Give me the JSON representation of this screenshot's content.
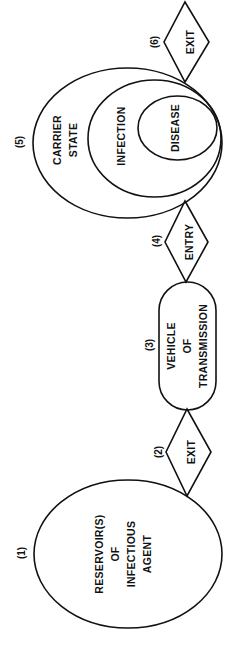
{
  "diagram": {
    "type": "chain-of-infection",
    "orientation": "rotated -90deg (reads bottom to top)",
    "nodes": [
      {
        "id": "reservoir",
        "number": "(1)",
        "shape": "ellipse",
        "lines": [
          "RESERVOIR(S)",
          "OF",
          "INFECTIOUS",
          "AGENT"
        ]
      },
      {
        "id": "exit-1",
        "number": "(2)",
        "shape": "diamond",
        "lines": [
          "EXIT"
        ]
      },
      {
        "id": "vehicle",
        "number": "(3)",
        "shape": "pill",
        "lines": [
          "VEHICLE",
          "OF",
          "TRANSMISSION"
        ]
      },
      {
        "id": "entry",
        "number": "(4)",
        "shape": "diamond",
        "lines": [
          "ENTRY"
        ]
      },
      {
        "id": "host",
        "number": "(5)",
        "shape": "nested-ellipses",
        "outer": {
          "lines": [
            "CARRIER",
            "STATE"
          ]
        },
        "middle": {
          "lines": [
            "INFECTION"
          ]
        },
        "inner": {
          "lines": [
            "DISEASE"
          ]
        }
      },
      {
        "id": "exit-2",
        "number": "(6)",
        "shape": "diamond",
        "lines": [
          "EXIT"
        ]
      }
    ],
    "edges": [
      [
        "reservoir",
        "exit-1"
      ],
      [
        "exit-1",
        "vehicle"
      ],
      [
        "vehicle",
        "entry"
      ],
      [
        "entry",
        "host"
      ],
      [
        "host",
        "exit-2"
      ]
    ]
  },
  "labels": {
    "n1": "(1)",
    "n2": "(2)",
    "n3": "(3)",
    "n4": "(4)",
    "n5": "(5)",
    "n6": "(6)",
    "reservoir": [
      "RESERVOIR(S)",
      "OF",
      "INFECTIOUS",
      "AGENT"
    ],
    "exit1": "EXIT",
    "vehicle": [
      "VEHICLE",
      "OF",
      "TRANSMISSION"
    ],
    "entry": "ENTRY",
    "carrier": [
      "CARRIER",
      "STATE"
    ],
    "infection": "INFECTION",
    "disease": "DISEASE",
    "exit2": "EXIT"
  },
  "colors": {
    "stroke": "#111111",
    "background": "#ffffff"
  }
}
